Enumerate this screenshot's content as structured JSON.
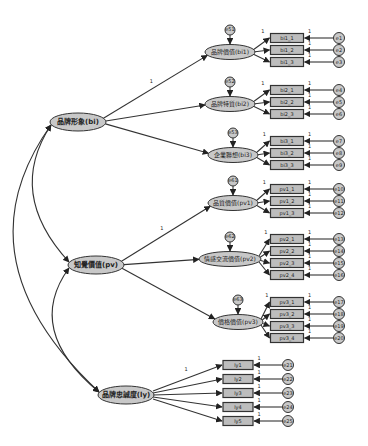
{
  "diagram": {
    "type": "sem-path-diagram",
    "colors": {
      "node_fill": "#c8c8c8",
      "box_fill": "#bdbdbd",
      "stroke": "#333333",
      "background": "#ffffff"
    },
    "second_order": [
      {
        "id": "bi",
        "label": "品牌形象(bi)",
        "x": 78,
        "y": 122
      },
      {
        "id": "pv",
        "label": "知覺價值(pv)",
        "x": 96,
        "y": 265
      },
      {
        "id": "ly",
        "label": "品牌忠誠度(ly)",
        "x": 126,
        "y": 395
      }
    ],
    "first_order": [
      {
        "id": "bi1",
        "label": "品牌價值(bi1)",
        "x": 230,
        "y": 52,
        "disturbance": "e51",
        "parent": "bi",
        "indicators": [
          {
            "label": "bi1_1",
            "error": "e1"
          },
          {
            "label": "bi1_2",
            "error": "e2"
          },
          {
            "label": "bi1_3",
            "error": "e3"
          }
        ]
      },
      {
        "id": "bi2",
        "label": "品牌特質(bi2)",
        "x": 230,
        "y": 104,
        "disturbance": "e52",
        "parent": "bi",
        "indicators": [
          {
            "label": "bi2_1",
            "error": "e4"
          },
          {
            "label": "bi2_2",
            "error": "e5"
          },
          {
            "label": "bi2_3",
            "error": "e6"
          }
        ]
      },
      {
        "id": "bi3",
        "label": "企業聯想(bi3)",
        "x": 233,
        "y": 155,
        "disturbance": "e53",
        "parent": "bi",
        "indicators": [
          {
            "label": "bi3_1",
            "error": "e7"
          },
          {
            "label": "bi3_2",
            "error": "e8"
          },
          {
            "label": "bi3_3",
            "error": "e9"
          }
        ]
      },
      {
        "id": "pv1",
        "label": "品質價值(pv1)",
        "x": 233,
        "y": 203,
        "disturbance": "e61",
        "parent": "pv",
        "indicators": [
          {
            "label": "pv1_1",
            "error": "e10"
          },
          {
            "label": "pv1_2",
            "error": "e11"
          },
          {
            "label": "pv1_3",
            "error": "e12"
          }
        ]
      },
      {
        "id": "pv2",
        "label": "情感交流價值(pv2)",
        "x": 230,
        "y": 259,
        "disturbance": "e62",
        "parent": "pv",
        "indicators": [
          {
            "label": "pv2_1",
            "error": "e13"
          },
          {
            "label": "pv2_2",
            "error": "e14"
          },
          {
            "label": "pv2_3",
            "error": "e15"
          },
          {
            "label": "pv2_4",
            "error": "e16"
          }
        ]
      },
      {
        "id": "pv3",
        "label": "價格價值(pv3)",
        "x": 238,
        "y": 322,
        "disturbance": "e63",
        "parent": "pv",
        "indicators": [
          {
            "label": "pv3_1",
            "error": "e17"
          },
          {
            "label": "pv3_2",
            "error": "e18"
          },
          {
            "label": "pv3_3",
            "error": "e19"
          },
          {
            "label": "pv3_4",
            "error": "e20"
          }
        ]
      }
    ],
    "direct_indicators": {
      "parent": "ly",
      "items": [
        {
          "label": "ly1",
          "error": "e21"
        },
        {
          "label": "ly2",
          "error": "e22"
        },
        {
          "label": "ly3",
          "error": "e23"
        },
        {
          "label": "ly4",
          "error": "e24"
        },
        {
          "label": "ly5",
          "error": "e25"
        }
      ]
    },
    "fixed_loading_label": "1",
    "covariances": [
      [
        "bi",
        "pv"
      ],
      [
        "pv",
        "ly"
      ],
      [
        "bi",
        "ly"
      ]
    ]
  }
}
